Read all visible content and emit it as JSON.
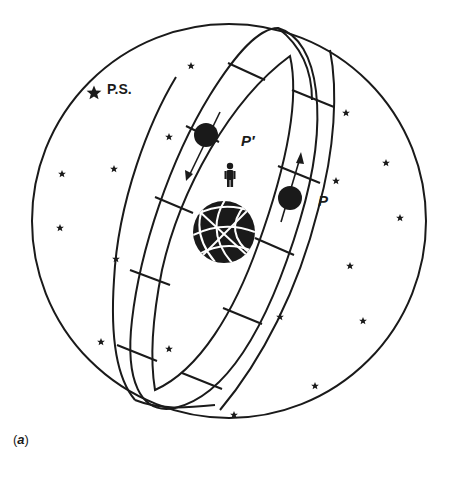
{
  "figure": {
    "caption": "(a)",
    "caption_inner": "a",
    "labels": {
      "pole_star": "P.S.",
      "planet_prime": "P′",
      "planet": "P"
    },
    "colors": {
      "ink": "#1a1a1a",
      "background": "#ffffff"
    },
    "elements": {
      "celestial_sphere": {
        "cx": 229,
        "cy": 221,
        "r": 197
      },
      "earth": {
        "cx": 224,
        "cy": 232,
        "r": 31
      },
      "observer": {
        "x": 230,
        "y": 180
      },
      "planet_prime": {
        "cx": 206,
        "cy": 135,
        "r": 12,
        "motion": "down-left"
      },
      "planet": {
        "cx": 290,
        "cy": 198,
        "r": 12,
        "motion": "up"
      },
      "pole_star": {
        "x": 94,
        "y": 93
      }
    },
    "stars": [
      [
        191,
        66
      ],
      [
        169,
        137
      ],
      [
        62,
        174
      ],
      [
        114,
        169
      ],
      [
        60,
        228
      ],
      [
        116,
        259
      ],
      [
        346,
        113
      ],
      [
        386,
        163
      ],
      [
        336,
        181
      ],
      [
        400,
        218
      ],
      [
        350,
        266
      ],
      [
        284,
        317
      ],
      [
        363,
        321
      ],
      [
        234,
        415
      ],
      [
        315,
        386
      ],
      [
        101,
        342
      ],
      [
        169,
        349
      ]
    ]
  }
}
